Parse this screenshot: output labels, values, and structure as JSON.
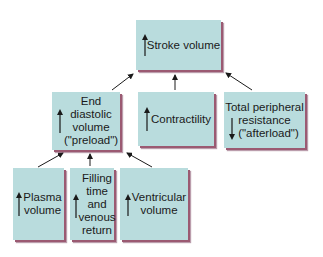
{
  "diagram": {
    "colors": {
      "box_fill": "#b9dcdd",
      "box_shadow": "#9b5a72",
      "arrow": "#1a1a1a"
    },
    "nodes": [
      {
        "id": "stroke-volume",
        "label": "Stroke volume",
        "direction": "up"
      },
      {
        "id": "edv",
        "label_lines": [
          "End diastolic",
          "volume",
          "(\"preload\")"
        ],
        "direction": "up"
      },
      {
        "id": "contractility",
        "label": "Contractility",
        "direction": "up"
      },
      {
        "id": "tpr",
        "label_lines": [
          "Total peripheral",
          "resistance",
          "(\"afterload\")"
        ],
        "direction": "down"
      },
      {
        "id": "plasma",
        "label_lines": [
          "Plasma",
          "volume"
        ],
        "direction": "up"
      },
      {
        "id": "filling",
        "label_lines": [
          "Filling",
          "time",
          "and",
          "venous",
          "return"
        ],
        "direction": "up"
      },
      {
        "id": "ventricular",
        "label_lines": [
          "Ventricular",
          "volume"
        ],
        "direction": "up"
      }
    ],
    "edges": [
      {
        "from": "edv",
        "to": "stroke-volume"
      },
      {
        "from": "contractility",
        "to": "stroke-volume"
      },
      {
        "from": "tpr",
        "to": "stroke-volume"
      },
      {
        "from": "plasma",
        "to": "edv"
      },
      {
        "from": "filling",
        "to": "edv"
      },
      {
        "from": "ventricular",
        "to": "edv"
      }
    ]
  }
}
